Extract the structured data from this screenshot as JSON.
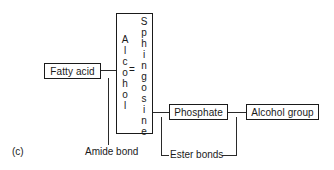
{
  "figure_label": "(c)",
  "boxes": {
    "fatty_acid": "Fatty acid",
    "alcohol_sphingosine": {
      "left_vertical": "Alcohol",
      "equals": "=",
      "right_vertical": "Sphingosine"
    },
    "phosphate": "Phosphate",
    "alcohol_group": "Alcohol group"
  },
  "bond_labels": {
    "amide": "Amide bond",
    "ester": "Ester bonds"
  }
}
